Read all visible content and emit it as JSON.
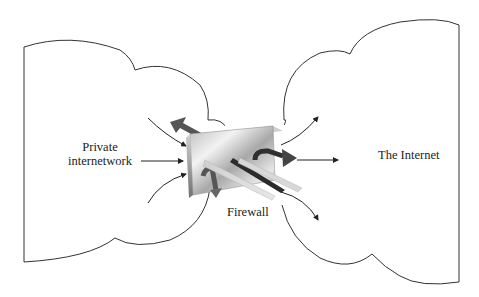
{
  "diagram": {
    "type": "network-firewall",
    "nodes": {
      "private": {
        "label_line1": "Private",
        "label_line2": "internetwork"
      },
      "internet": {
        "label": "The Internet"
      },
      "firewall": {
        "label": "Firewall"
      }
    },
    "colors": {
      "stroke": "#333333",
      "arrow_dark": "#2a2a2a",
      "arrow_mid": "#6a6a6a",
      "box_light": "#e8e8e8",
      "box_dark": "#8a8a8a"
    }
  }
}
